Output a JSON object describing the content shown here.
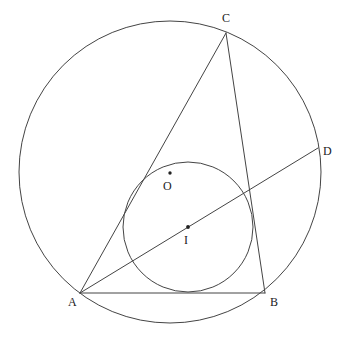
{
  "figure": {
    "kind": "euclidean-geometry-diagram",
    "width": 348,
    "height": 340,
    "background_color": "#ffffff",
    "stroke_color": "#444444",
    "dot_color": "#222222"
  },
  "labels": {
    "A": "A",
    "B": "B",
    "C": "C",
    "D": "D",
    "O": "O",
    "I": "I"
  },
  "chart_data": {
    "type": "scatter",
    "title": "",
    "xlabel": "",
    "ylabel": "",
    "points": [
      {
        "name": "A",
        "x": 80,
        "y": 293,
        "role": "triangle-vertex"
      },
      {
        "name": "B",
        "x": 265,
        "y": 293,
        "role": "triangle-vertex"
      },
      {
        "name": "C",
        "x": 226,
        "y": 33,
        "role": "triangle-vertex"
      },
      {
        "name": "D",
        "x": 318,
        "y": 148,
        "role": "point-on-circumcircle"
      },
      {
        "name": "O",
        "x": 170,
        "y": 173,
        "role": "circumcenter"
      },
      {
        "name": "I",
        "x": 188,
        "y": 227,
        "role": "incenter"
      }
    ],
    "circles": [
      {
        "name": "circumcircle",
        "center": [
          170,
          172
        ],
        "radius": 151
      },
      {
        "name": "incircle",
        "center": [
          188,
          227
        ],
        "radius": 65
      }
    ],
    "segments": [
      {
        "name": "AB",
        "from": [
          80,
          293
        ],
        "to": [
          265,
          293
        ]
      },
      {
        "name": "AC",
        "from": [
          80,
          293
        ],
        "to": [
          226,
          33
        ]
      },
      {
        "name": "CB",
        "from": [
          226,
          33
        ],
        "to": [
          265,
          293
        ]
      },
      {
        "name": "AD",
        "from": [
          80,
          293
        ],
        "to": [
          318,
          148
        ]
      }
    ],
    "label_positions": [
      {
        "name": "A",
        "x": 68,
        "y": 296
      },
      {
        "name": "B",
        "x": 270,
        "y": 296
      },
      {
        "name": "C",
        "x": 222,
        "y": 12
      },
      {
        "name": "D",
        "x": 323,
        "y": 145
      },
      {
        "name": "O",
        "x": 163,
        "y": 180
      },
      {
        "name": "I",
        "x": 184,
        "y": 234
      }
    ]
  }
}
